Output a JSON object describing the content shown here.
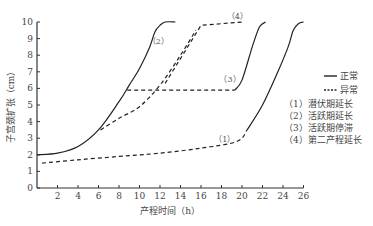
{
  "chart_data": {
    "type": "line",
    "title": "",
    "xlabel": "产程时间（h）",
    "ylabel": "子宫颈扩张（cm）",
    "xlim": [
      0,
      26
    ],
    "ylim": [
      0,
      10
    ],
    "xticks": [
      2,
      4,
      6,
      8,
      10,
      12,
      14,
      16,
      18,
      20,
      22,
      24,
      26
    ],
    "yticks": [
      0,
      1,
      2,
      3,
      4,
      5,
      6,
      7,
      8,
      9,
      10
    ],
    "grid": false,
    "legend_position": "right",
    "legend": [
      {
        "style": "solid",
        "label": "正常"
      },
      {
        "style": "dashed",
        "label": "异常"
      }
    ],
    "annotations": [
      {
        "label": "（1）",
        "meaning": "潜伏期延长"
      },
      {
        "label": "（2）",
        "meaning": "活跃期延长"
      },
      {
        "label": "（3）",
        "meaning": "活跃期停滞"
      },
      {
        "label": "（4）",
        "meaning": "第二产程延长"
      }
    ],
    "series": [
      {
        "name": "正常",
        "style": "solid",
        "x": [
          0,
          2,
          4,
          6,
          8,
          9,
          10,
          11,
          11.5,
          12,
          12.5,
          13.5
        ],
        "y": [
          2,
          2.1,
          2.5,
          3.5,
          5.2,
          6.2,
          7.2,
          8.5,
          9.4,
          9.8,
          10,
          10
        ]
      },
      {
        "name": "(1) 潜伏期延长 异常",
        "style": "dashed",
        "x": [
          0.5,
          4,
          8,
          12,
          16,
          19.5,
          20.5
        ],
        "y": [
          1.5,
          1.7,
          1.9,
          2.1,
          2.4,
          2.8,
          3.5
        ]
      },
      {
        "name": "(1) 潜伏期延长 后续正常",
        "style": "solid",
        "x": [
          20.5,
          22,
          23.5,
          24.5,
          25,
          25.5,
          26
        ],
        "y": [
          3.5,
          5,
          7,
          8.5,
          9.5,
          9.9,
          10
        ]
      },
      {
        "name": "(2) 活跃期延长",
        "style": "dashed",
        "x": [
          6.2,
          8,
          10,
          12,
          14,
          15.5
        ],
        "y": [
          3.5,
          4.2,
          4.9,
          6.2,
          8,
          9.5
        ]
      },
      {
        "name": "(3) 活跃期停滞 异常",
        "style": "dashed",
        "x": [
          8.8,
          19.3
        ],
        "y": [
          5.9,
          5.9
        ]
      },
      {
        "name": "(3) 活跃期停滞 后续正常",
        "style": "solid",
        "x": [
          19.3,
          20,
          21,
          21.7,
          22.3
        ],
        "y": [
          5.9,
          6.5,
          8.5,
          9.7,
          10
        ]
      },
      {
        "name": "(4) 第二产程延长",
        "style": "dashed",
        "x": [
          12.5,
          16,
          20
        ],
        "y": [
          6.3,
          9.8,
          10
        ]
      }
    ]
  }
}
